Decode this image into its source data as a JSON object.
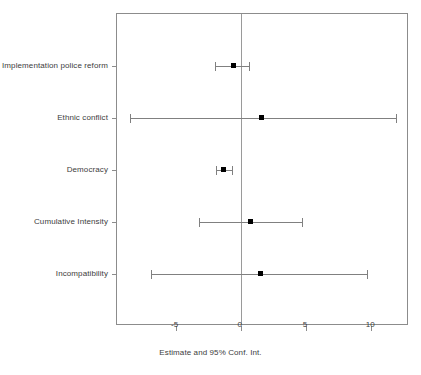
{
  "chart_data": {
    "type": "scatter",
    "title": "",
    "subtitle": "",
    "xlabel": "Estimate and 95% Conf. Int.",
    "ylabel": "",
    "xlim": [
      -9.5,
      12.9
    ],
    "ylim": [
      0,
      6
    ],
    "grid": false,
    "legend": null,
    "xticks": [
      -5,
      0,
      5,
      10
    ],
    "xticklabels": [
      "-5",
      "0",
      "5",
      "10"
    ],
    "reference_line": 0,
    "categories": [
      "Implementation police reform",
      "Ethnic conflict",
      "Democracy",
      "Cumulative Intensity",
      "Incompatibility"
    ],
    "points": [
      {
        "label": "Implementation police reform",
        "estimate": -0.6,
        "ci_low": -2.0,
        "ci_high": 0.6
      },
      {
        "label": "Ethnic conflict",
        "estimate": 1.6,
        "ci_low": -8.5,
        "ci_high": 11.9
      },
      {
        "label": "Democracy",
        "estimate": -1.3,
        "ci_low": -1.9,
        "ci_high": -0.7
      },
      {
        "label": "Cumulative Intensity",
        "estimate": 0.75,
        "ci_low": -3.2,
        "ci_high": 4.7
      },
      {
        "label": "Incompatibility",
        "estimate": 1.5,
        "ci_low": -6.9,
        "ci_high": 9.7
      }
    ],
    "colors": {
      "point": "#000000",
      "interval": "#808080",
      "frame": "#8c8c8c",
      "reference": "#9a9a9a",
      "text": "#3d3d3d",
      "background": "#ffffff"
    }
  }
}
